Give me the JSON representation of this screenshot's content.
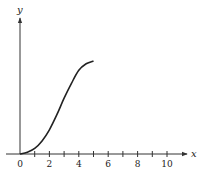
{
  "chart_data": {
    "type": "line",
    "title": "",
    "xlabel": "x",
    "ylabel": "y",
    "xlim": [
      0,
      11
    ],
    "x_ticks": [
      0,
      1,
      2,
      3,
      4,
      5,
      6,
      7,
      8,
      9,
      10
    ],
    "x_tick_labels": [
      "0",
      "2",
      "4",
      "6",
      "8",
      "10"
    ],
    "y_ticks": [],
    "grid": false,
    "legend": null,
    "series": [
      {
        "name": "curve",
        "description": "S-shaped (logistic-like) curve starting at origin, rising steeply, leveling off near x=5",
        "x": [
          0,
          0.5,
          1,
          1.5,
          2,
          2.5,
          3,
          3.5,
          4,
          4.5,
          5
        ],
        "y_relative": [
          0,
          0.02,
          0.06,
          0.14,
          0.26,
          0.42,
          0.6,
          0.76,
          0.9,
          0.97,
          1.0
        ]
      }
    ]
  }
}
